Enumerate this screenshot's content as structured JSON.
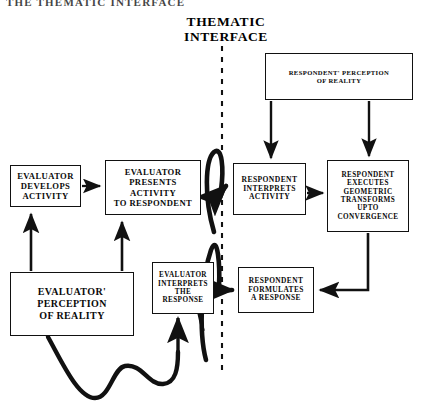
{
  "page": {
    "header_partial_text": "THE THEMATIC INTERFACE",
    "thematic_title": "THEMATIC\nINTERFACE"
  },
  "nodes": {
    "evaluator_develops": "EVALUATOR\nDEVELOPS\nACTIVITY",
    "evaluator_presents": "EVALUATOR\nPRESENTS\nACTIVITY\nTO RESPONDENT",
    "evaluator_perception": "EVALUATOR'\nPERCEPTION\nOF REALITY",
    "evaluator_interprets": "EVALUATOR\nINTERPRETS THE\nRESPONSE",
    "respondent_perception": "RESPONDENT' PERCEPTION\nOF REALITY",
    "respondent_interprets": "RESPONDENT\nINTERPRETS\nACTIVITY",
    "respondent_executes": "RESPONDENT\nEXECUTES\nGEOMETRIC\nTRANSFORMS\nUPTO\nCONVERGENCE",
    "respondent_formulates": "RESPONDENT\nFORMULATES\nA RESPONSE"
  },
  "connectors": {
    "develops_to_presents": "arrow-right",
    "perception_to_develops": "arrow-up",
    "perception_to_presents": "arrow-up",
    "presents_to_interprets_loop": "thick-loop-arrow-right",
    "respondent_perception_to_interprets": "arrow-down",
    "respondent_perception_to_executes": "arrow-down",
    "interprets_to_executes": "arrow-right",
    "executes_to_formulates": "elbow-arrow-left",
    "formulates_to_evaluator_interprets_loop": "thick-loop-arrow-left",
    "evaluator_interprets_return_wave": "thick-wave",
    "interface_divider": "dashed-vertical-line"
  },
  "colors": {
    "stroke": "#111111",
    "background": "#ffffff",
    "text": "#0a0a0a"
  }
}
